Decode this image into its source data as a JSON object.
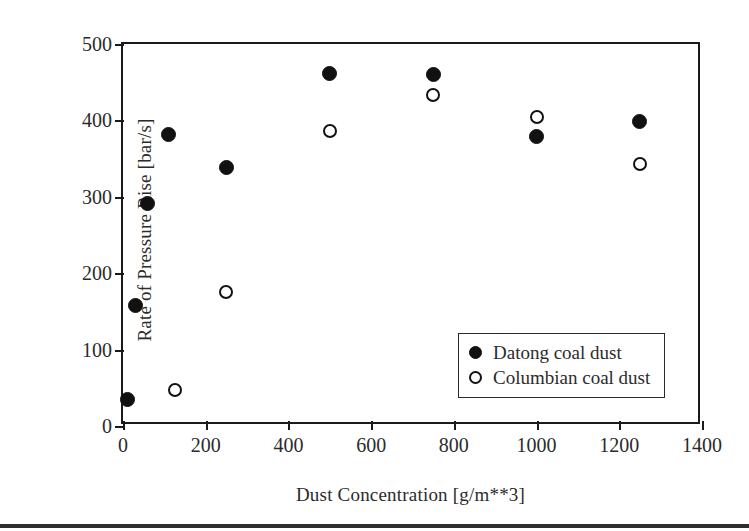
{
  "chart_data": {
    "type": "scatter",
    "title": "",
    "xlabel": "Dust Concentration [g/m**3]",
    "ylabel": "Rate of Pressure Rise [bar/s]",
    "xlim": [
      0,
      1400
    ],
    "ylim": [
      0,
      500
    ],
    "xticks": [
      0,
      200,
      400,
      600,
      800,
      1000,
      1200,
      1400
    ],
    "yticks": [
      0,
      100,
      200,
      300,
      400,
      500
    ],
    "xtick_labels": [
      "0",
      "200",
      "400",
      "600",
      "800",
      "1000",
      "1200",
      "1400"
    ],
    "ytick_labels": [
      "0",
      "100",
      "200",
      "300",
      "400",
      "500"
    ],
    "grid": false,
    "legend_position": "lower-right-inside",
    "series": [
      {
        "name": "Datong coal dust",
        "marker": "filled-circle",
        "color": "#111111",
        "points": [
          {
            "x": 10,
            "y": 35
          },
          {
            "x": 30,
            "y": 158
          },
          {
            "x": 60,
            "y": 291
          },
          {
            "x": 110,
            "y": 382
          },
          {
            "x": 250,
            "y": 338
          },
          {
            "x": 500,
            "y": 462
          },
          {
            "x": 750,
            "y": 460
          },
          {
            "x": 1000,
            "y": 379
          },
          {
            "x": 1250,
            "y": 398
          }
        ]
      },
      {
        "name": "Columbian coal dust",
        "marker": "open-circle",
        "color": "#111111",
        "points": [
          {
            "x": 125,
            "y": 47
          },
          {
            "x": 250,
            "y": 175
          },
          {
            "x": 500,
            "y": 386
          },
          {
            "x": 750,
            "y": 433
          },
          {
            "x": 1000,
            "y": 405
          },
          {
            "x": 1250,
            "y": 343
          }
        ]
      }
    ]
  },
  "legend": {
    "entries": [
      {
        "label": "Datong coal dust",
        "marker": "filled-circle"
      },
      {
        "label": "Columbian coal dust",
        "marker": "open-circle"
      }
    ]
  }
}
